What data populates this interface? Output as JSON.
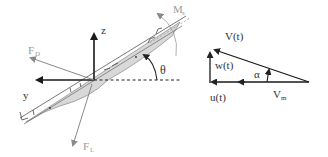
{
  "diagram": {
    "colors": {
      "axis": "#1a1a1a",
      "force": "#8a8a8a",
      "hull_fill": "#d8d8d8",
      "hull_line": "#555555",
      "label_dark": "#333333",
      "label_light": "#9a9a9a"
    },
    "left_panel": {
      "labels": {
        "z": "z",
        "y": "y",
        "drag_force": "F",
        "drag_force_sub": "D",
        "lift_force": "F",
        "lift_force_sub": "L",
        "moment": "M",
        "moment_sub": "s",
        "angle": "θ"
      }
    },
    "right_panel": {
      "labels": {
        "velocity": "V(t)",
        "vertical_component": "w(t)",
        "horizontal_component": "u(t)",
        "angle": "α",
        "mean_velocity": "V",
        "mean_velocity_sub": "m"
      }
    }
  }
}
